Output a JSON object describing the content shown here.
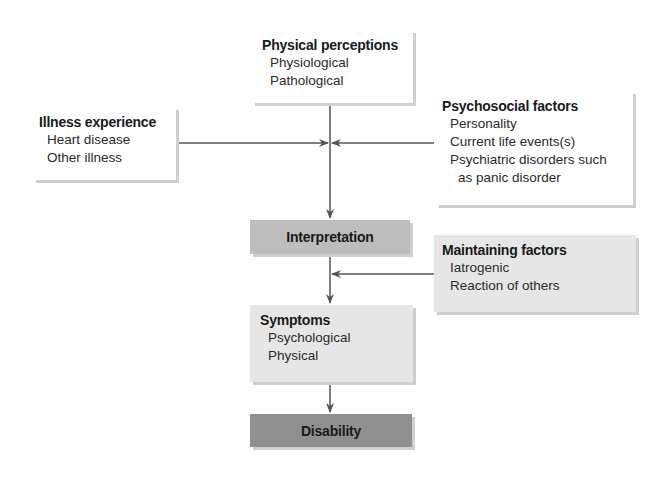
{
  "diagram": {
    "physical_perceptions": {
      "title": "Physical perceptions",
      "items": [
        "Physiological",
        "Pathological"
      ]
    },
    "illness_experience": {
      "title": "Illness experience",
      "items": [
        "Heart disease",
        "Other illness"
      ]
    },
    "psychosocial_factors": {
      "title": "Psychosocial factors",
      "items": [
        "Personality",
        "Current life events(s)",
        "Psychiatric disorders such",
        "as panic disorder"
      ]
    },
    "interpretation": {
      "title": "Interpretation"
    },
    "maintaining_factors": {
      "title": "Maintaining factors",
      "items": [
        "Iatrogenic",
        "Reaction of others"
      ]
    },
    "symptoms": {
      "title": "Symptoms",
      "items": [
        "Psychological",
        "Physical"
      ]
    },
    "disability": {
      "title": "Disability"
    }
  },
  "colors": {
    "line": "#555555",
    "interpretation_fill": "#bdbdbd",
    "maintaining_fill": "#e6e6e6",
    "symptoms_fill": "#e6e6e6",
    "disability_fill": "#8f8f8f"
  }
}
